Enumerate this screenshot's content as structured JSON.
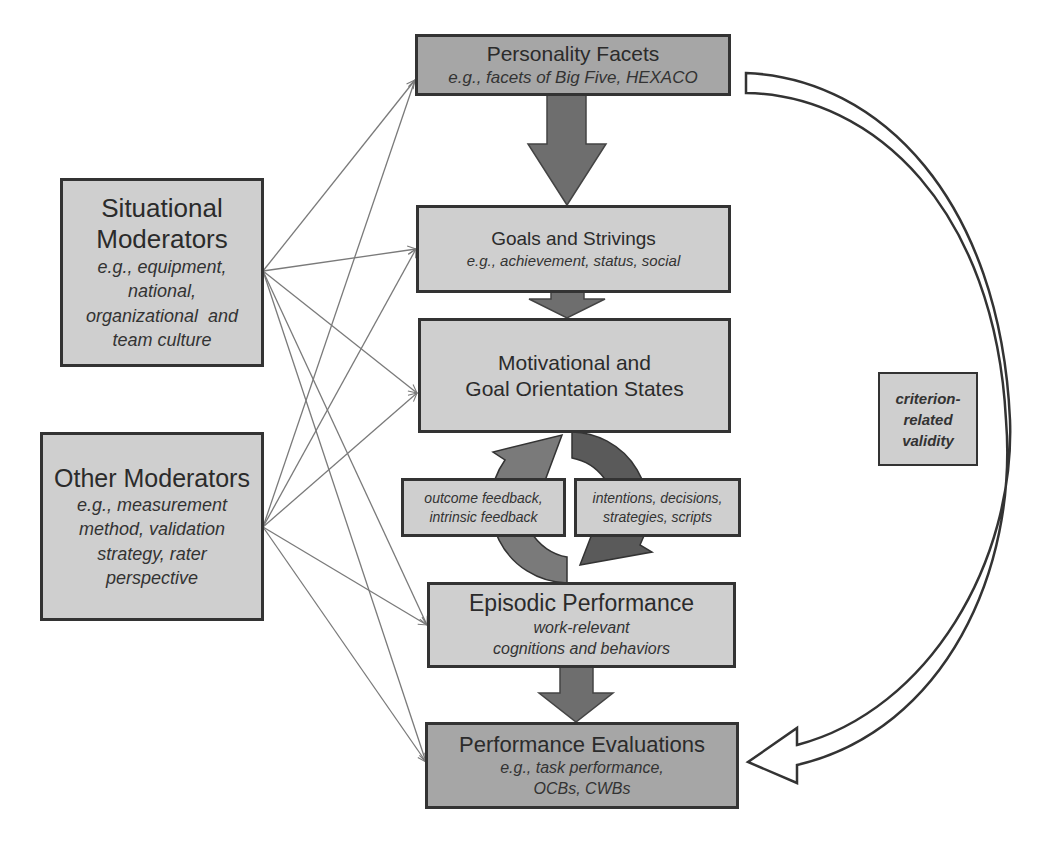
{
  "colors": {
    "box_light": "#cfcfcf",
    "box_dark": "#a6a6a6",
    "border": "#333333",
    "flow_arrow": "#6e6e6e",
    "connector_line": "#7a7a7a",
    "cycle_left": "#7a7a7a",
    "cycle_right": "#5a5a5a"
  },
  "chain": {
    "personality": {
      "title": "Personality Facets",
      "subtitle": "e.g., facets of Big Five, HEXACO"
    },
    "goals": {
      "title": "Goals and Strivings",
      "subtitle": "e.g., achievement, status, social"
    },
    "motivational": {
      "line1": "Motivational and",
      "line2": "Goal Orientation States"
    },
    "episodic": {
      "title": "Episodic Performance",
      "line1": "work-relevant",
      "line2": "cognitions and behaviors"
    },
    "evaluations": {
      "title": "Performance Evaluations",
      "line1": "e.g., task performance,",
      "line2": "OCBs, CWBs"
    }
  },
  "cycle": {
    "feedback": {
      "line1": "outcome feedback,",
      "line2": "intrinsic feedback"
    },
    "intentions": {
      "line1": "intentions, decisions,",
      "line2": "strategies, scripts"
    }
  },
  "moderators": {
    "situational": {
      "title1": "Situational",
      "title2": "Moderators",
      "examples": [
        "e.g., equipment,",
        "national,",
        "organizational  and",
        "team culture"
      ]
    },
    "other": {
      "title": "Other Moderators",
      "examples": [
        "e.g., measurement",
        "method, validation",
        "strategy, rater",
        "perspective"
      ]
    }
  },
  "validity": {
    "line1": "criterion-",
    "line2": "related",
    "line3": "validity"
  },
  "connections": {
    "sources": [
      "situational",
      "other"
    ],
    "targets": [
      "personality",
      "goals",
      "motivational",
      "episodic",
      "evaluations"
    ]
  }
}
